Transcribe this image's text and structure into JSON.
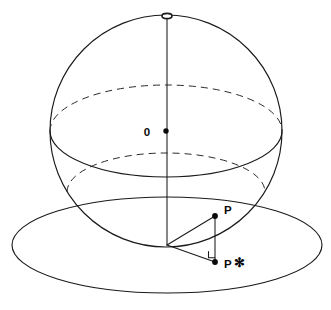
{
  "figure": {
    "kind": "geometry-diagram",
    "background_color": "#ffffff",
    "line_color": "#1a1a1a",
    "dash_color": "#2b2b2b",
    "dot_color": "#0a0a0a"
  },
  "labels": {
    "center": "0",
    "point_p": "P",
    "point_p_star": "P",
    "point_p_star_mark": "✻"
  },
  "geometry": {
    "sphere": {
      "name": "sphere-outline",
      "center_x": 166,
      "center_y": 131,
      "radius": 116
    },
    "equator": {
      "name": "equator-ellipse",
      "center_x": 166,
      "center_y": 131,
      "rx": 116,
      "ry": 46,
      "back_half": "dashed",
      "front_half": "solid"
    },
    "plane_intersection_circle": {
      "name": "sphere-plane-intersection",
      "center_x": 166,
      "center_y": 192,
      "rx": 99,
      "ry": 39,
      "back_half": "dashed",
      "front_half": "hidden"
    },
    "plane": {
      "name": "horizontal-plane-ellipse",
      "center_x": 167,
      "center_y": 245,
      "rx": 155,
      "ry": 48
    },
    "axis": {
      "name": "vertical-axis",
      "x": 167,
      "y_top": 17,
      "y_bottom": 245
    },
    "north_pole_marker": {
      "name": "north-pole-ellipse",
      "cx": 167,
      "cy": 16,
      "rx": 5,
      "ry": 2.6
    },
    "center_dot": {
      "cx": 166,
      "cy": 131,
      "r": 2.7
    },
    "point_p": {
      "cx": 215,
      "cy": 216,
      "r": 2.9
    },
    "point_p_star": {
      "cx": 215,
      "cy": 262,
      "r": 2.9
    },
    "triangle_vertex": {
      "x": 167,
      "y": 245
    },
    "right_angle_marker": {
      "x": 209,
      "y": 250,
      "size": 7
    }
  },
  "label_positions": {
    "center": {
      "x": 147,
      "y": 136
    },
    "point_p": {
      "x": 224,
      "y": 214
    },
    "point_p_star": {
      "x": 224,
      "y": 268
    },
    "point_p_star_mark": {
      "x": 236,
      "y": 266
    }
  }
}
